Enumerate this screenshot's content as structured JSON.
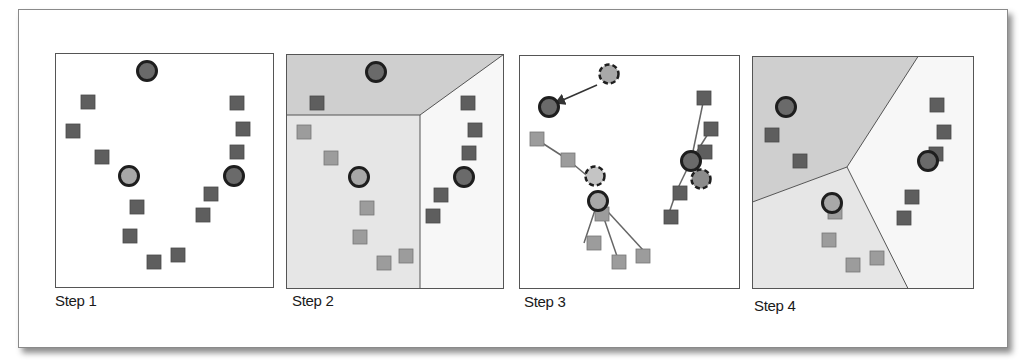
{
  "figure": {
    "colors": {
      "dark_point": "#5e5e5e",
      "light_point": "#9c9c9c",
      "centroid_dark": "#6a6a6a",
      "centroid_light": "#a8a8a8",
      "centroid_stroke": "#1e1e1e",
      "region_dark": "#cfcfcf",
      "region_mid": "#e6e6e6",
      "region_light": "#f7f7f7",
      "border": "#555555"
    },
    "panels": [
      {
        "id": "step1",
        "label": "Step 1"
      },
      {
        "id": "step2",
        "label": "Step 2"
      },
      {
        "id": "step3",
        "label": "Step 3"
      },
      {
        "id": "step4",
        "label": "Step 4"
      }
    ]
  }
}
